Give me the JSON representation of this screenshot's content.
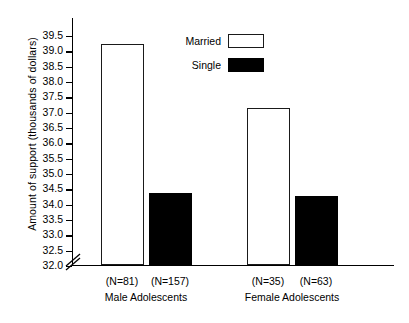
{
  "chart_data": {
    "type": "bar",
    "title": "",
    "xlabel": "",
    "ylabel": "Amount of support (thousands of dollars)",
    "ylim": [
      32.0,
      39.5
    ],
    "y_axis_break": true,
    "grid": false,
    "legend_position": "top-center-right",
    "yticks": [
      "39.5",
      "39.0",
      "38.5",
      "38.0",
      "37.5",
      "37.0",
      "36.5",
      "36.0",
      "35.5",
      "35.0",
      "34.5",
      "34.0",
      "33.5",
      "33.0",
      "32.5",
      "32.0"
    ],
    "ytick_values": [
      39.5,
      39.0,
      38.5,
      38.0,
      37.5,
      37.0,
      36.5,
      36.0,
      35.5,
      35.0,
      34.5,
      34.0,
      33.5,
      33.0,
      32.5,
      32.0
    ],
    "groups": [
      "Male Adolescents",
      "Female Adolescents"
    ],
    "categories": [
      "(N=81)",
      "(N=157)",
      "(N=35)",
      "(N=63)"
    ],
    "series": [
      {
        "name": "Married",
        "style": "open",
        "values": [
          39.2,
          null,
          37.1,
          null
        ]
      },
      {
        "name": "Single",
        "style": "filled",
        "values": [
          null,
          34.35,
          null,
          34.25
        ]
      }
    ],
    "bars": [
      {
        "label": "(N=81)",
        "group": "Male Adolescents",
        "series": "Married",
        "value": 39.2,
        "style": "open"
      },
      {
        "label": "(N=157)",
        "group": "Male Adolescents",
        "series": "Single",
        "value": 34.35,
        "style": "filled"
      },
      {
        "label": "(N=35)",
        "group": "Female Adolescents",
        "series": "Married",
        "value": 37.1,
        "style": "open"
      },
      {
        "label": "(N=63)",
        "group": "Female Adolescents",
        "series": "Single",
        "value": 34.25,
        "style": "filled"
      }
    ]
  },
  "legend": {
    "items": [
      {
        "label": "Married",
        "style": "open"
      },
      {
        "label": "Single",
        "style": "filled"
      }
    ]
  },
  "colors": {
    "axis": "#000000",
    "bar_open_fill": "#ffffff",
    "bar_open_stroke": "#1a1a1a",
    "bar_filled": "#000000",
    "background": "#ffffff",
    "text": "#000000"
  }
}
